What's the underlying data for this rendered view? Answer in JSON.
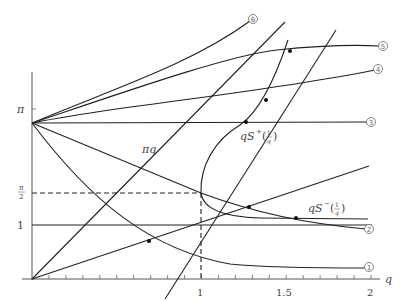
{
  "figure": {
    "width": 410,
    "height": 301,
    "origin_px": [
      32,
      279
    ],
    "px_per_unit_x": 169.5,
    "px_per_unit_y": 54,
    "x_axis": {
      "label": "q",
      "tick_labels": [
        {
          "value": 1,
          "text": "1"
        },
        {
          "value": 1.5,
          "text": "1.5"
        },
        {
          "value": 2,
          "text": "2"
        }
      ],
      "minor_tick_step": 0.1,
      "range": [
        0,
        2.1
      ]
    },
    "y_axis": {
      "tick_labels": [
        {
          "value": 1,
          "text": "1"
        },
        {
          "value": 1.5708,
          "text": "π/2",
          "num": "π",
          "den": "2"
        },
        {
          "value": 3.1416,
          "text": "π"
        }
      ],
      "range": [
        0,
        3.35
      ]
    },
    "labels": {
      "pi_q": "πq",
      "qS_plus": "qS⁺(1/q)",
      "qS_plus_main": "qS",
      "qS_plus_sup": "+",
      "qS_minus_main": "qS",
      "qS_minus_sup": "−",
      "frac_num": "1",
      "frac_den": "q",
      "x_label": "q"
    },
    "curve_markers": [
      {
        "id": 1,
        "glyph": "①",
        "px": [
          369,
          267
        ]
      },
      {
        "id": 2,
        "glyph": "②",
        "px": [
          369,
          229
        ]
      },
      {
        "id": 3,
        "glyph": "③",
        "px": [
          371,
          122
        ]
      },
      {
        "id": 4,
        "glyph": "④",
        "px": [
          378,
          69
        ]
      },
      {
        "id": 5,
        "glyph": "⑤",
        "px": [
          383,
          46
        ]
      },
      {
        "id": 6,
        "glyph": "⑥",
        "px": [
          253,
          19
        ]
      }
    ],
    "dashed_guides": {
      "horizontal_at_y": 1.5708,
      "vertical_at_x": 1
    }
  },
  "chart_data": {
    "type": "line",
    "title": "",
    "xlabel": "q",
    "ylabel": "",
    "xlim": [
      0,
      2
    ],
    "ylim": [
      0,
      3.3
    ],
    "grid": false,
    "series": [
      {
        "name": "curve ①",
        "x": [
          0,
          0.25,
          0.5,
          0.75,
          1.0,
          1.25,
          1.5,
          2.0
        ],
        "y": [
          2.89,
          1.95,
          1.35,
          0.88,
          0.55,
          0.38,
          0.33,
          0.31
        ]
      },
      {
        "name": "curve ②",
        "x": [
          0,
          0.5,
          1.0,
          1.5,
          2.0
        ],
        "y": [
          2.89,
          2.2,
          1.57,
          1.18,
          0.88
        ]
      },
      {
        "name": "curve ③",
        "x": [
          0,
          2.0
        ],
        "y": [
          2.89,
          2.91
        ]
      },
      {
        "name": "curve ④",
        "x": [
          0,
          0.5,
          1.0,
          1.5,
          2.0
        ],
        "y": [
          2.89,
          3.15,
          3.45,
          3.82,
          4.3
        ]
      },
      {
        "name": "curve ⑤",
        "x": [
          0,
          0.5,
          1.0,
          1.5,
          2.0
        ],
        "y": [
          2.89,
          3.4,
          4.1,
          4.75,
          4.95
        ]
      },
      {
        "name": "curve ⑥",
        "x": [
          0,
          0.4,
          0.8,
          1.2,
          1.3
        ],
        "y": [
          2.89,
          3.6,
          4.5,
          5.6,
          5.9
        ]
      },
      {
        "name": "πq",
        "x": [
          0,
          1.3
        ],
        "y": [
          0,
          4.08
        ]
      },
      {
        "name": "line through origin (slope ≈1)",
        "x": [
          0,
          2.0
        ],
        "y": [
          0,
          2.0
        ]
      },
      {
        "name": "horizontal line y=1",
        "x": [
          0,
          2.0
        ],
        "y": [
          1,
          1
        ]
      },
      {
        "name": "qS⁺(1/q)",
        "x": [
          1.0,
          1.02,
          1.1,
          1.25,
          1.4,
          1.65
        ],
        "y": [
          1.57,
          2.2,
          2.65,
          2.9,
          3.35,
          4.4
        ]
      },
      {
        "name": "qS⁻(1/q)",
        "x": [
          1.0,
          1.05,
          1.2,
          1.5,
          2.0
        ],
        "y": [
          1.57,
          1.25,
          1.12,
          1.09,
          1.08
        ]
      },
      {
        "name": "line through origin (slope ≈2.1)",
        "x": [
          0,
          2.05
        ],
        "y": [
          0,
          4.3
        ]
      }
    ],
    "annotations": [
      "πq",
      "qS⁺(1/q)",
      "qS⁻(1/q)",
      "①",
      "②",
      "③",
      "④",
      "⑤",
      "⑥"
    ],
    "x_tick_labels": [
      "1",
      "1.5",
      "2"
    ],
    "y_tick_labels": [
      "1",
      "π/2",
      "π"
    ]
  }
}
